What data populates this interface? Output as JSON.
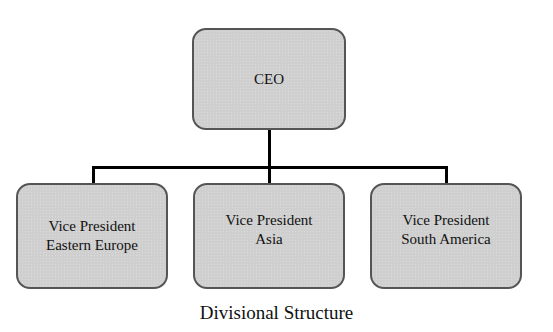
{
  "diagram": {
    "type": "org-chart",
    "root": {
      "label": "CEO"
    },
    "children": [
      {
        "line1": "Vice President",
        "line2": "Eastern Europe"
      },
      {
        "line1": "Vice President",
        "line2": "Asia"
      },
      {
        "line1": "Vice President",
        "line2": "South America"
      }
    ],
    "caption": "Divisional Structure",
    "colors": {
      "box_fill": "#cfcfcf",
      "box_border": "#555555",
      "connector": "#000000"
    }
  }
}
